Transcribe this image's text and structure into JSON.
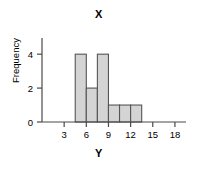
{
  "chart_data": {
    "type": "bar",
    "title": "X",
    "xlabel": "Y",
    "ylabel": "Frequency",
    "categories": [
      "4.5-6",
      "6-7.5",
      "7.5-9",
      "9-10.5",
      "10.5-12",
      "12-13.5"
    ],
    "bin_edges": [
      4.5,
      6,
      7.5,
      9,
      10.5,
      12,
      13.5
    ],
    "values": [
      4,
      2,
      4,
      1,
      1,
      1
    ],
    "xlim": [
      0,
      19.5
    ],
    "ylim": [
      0,
      4.6
    ],
    "xticks": [
      3,
      6,
      9,
      12,
      15,
      18
    ],
    "xtick_labels": [
      "3",
      "6",
      "9",
      "12",
      "15",
      "18"
    ],
    "yticks": [
      0,
      2,
      4
    ],
    "ytick_labels": [
      "0",
      "2",
      "4"
    ],
    "grid": false,
    "legend": false,
    "bar_fill": "#d4d4d4",
    "bar_stroke": "#555555",
    "axis_color": "#4a4a4a"
  }
}
